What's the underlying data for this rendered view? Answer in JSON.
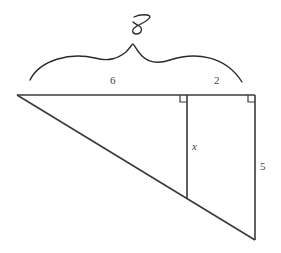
{
  "figure": {
    "type": "geometry",
    "colors": {
      "line": "#3a3a3a",
      "label": "#444444",
      "handwriting": "#2a2a2a",
      "background": "#ffffff"
    }
  },
  "labels": {
    "top_left_segment": "6",
    "top_right_segment": "2",
    "inner_vertical": "x",
    "right_side": "5",
    "handwritten_total": "8"
  },
  "annotations": {
    "brace": "curly brace spanning the full top side (6 + 2)",
    "right_angle_markers": 2
  }
}
